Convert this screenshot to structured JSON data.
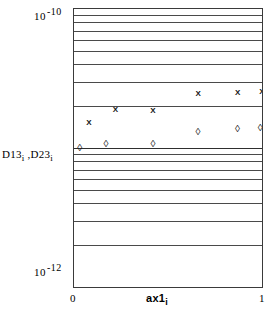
{
  "figure": {
    "background_color": "#ffffff",
    "frame_color": "#3a3a3a",
    "grid_color": "#4a4a4a"
  },
  "axes": {
    "y_top_mantissa": "10",
    "y_top_exponent": "-10",
    "y_bottom_mantissa": "10",
    "y_bottom_exponent": "-12",
    "y_label_first": "D13",
    "y_label_first_sub": "i",
    "y_label_separator": " ,",
    "y_label_second": "D23",
    "y_label_second_sub": "i",
    "x_tick_min": "0",
    "x_tick_max": "1",
    "x_label": "ax1",
    "x_label_sub": "i"
  },
  "chart_data": {
    "type": "scatter",
    "title": "",
    "xlabel": "ax1_i",
    "ylabel": "D13_i , D23_i",
    "xlim": [
      0,
      1
    ],
    "ylim": [
      1e-12,
      1e-10
    ],
    "yscale": "log",
    "xscale": "linear",
    "grid": true,
    "grid_orientation": "horizontal",
    "legend": "none",
    "series": [
      {
        "name": "D13_i",
        "marker": "x",
        "x": [
          0.08,
          0.22,
          0.42,
          0.66,
          0.87,
          1.0
        ],
        "y": [
          1.55e-11,
          1.92e-11,
          1.88e-11,
          2.48e-11,
          2.52e-11,
          2.55e-11
        ]
      },
      {
        "name": "D23_i",
        "marker": "diamond",
        "x": [
          0.03,
          0.17,
          0.42,
          0.66,
          0.87,
          0.99
        ],
        "y": [
          1.01e-11,
          1.08e-11,
          1.08e-11,
          1.32e-11,
          1.4e-11,
          1.41e-11
        ]
      }
    ],
    "y_gridline_values": [
      9e-11,
      8e-11,
      7e-11,
      6e-11,
      5e-11,
      4e-11,
      3e-11,
      2e-11,
      1e-11,
      9e-12,
      8e-12,
      7e-12,
      6e-12,
      5e-12,
      4e-12,
      3e-12,
      2e-12
    ]
  },
  "markers": {
    "cross_glyph": "X",
    "diamond_glyph": "◊"
  }
}
